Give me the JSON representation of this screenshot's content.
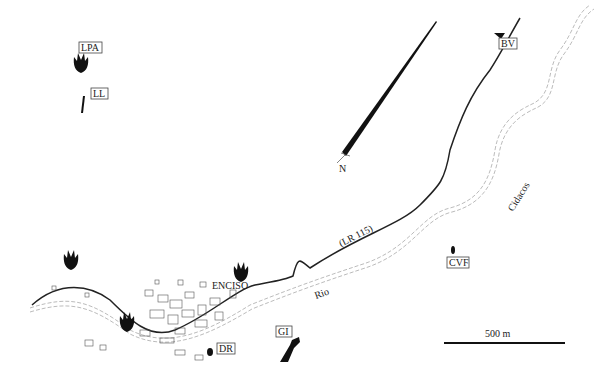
{
  "map": {
    "town_label": "ENCISO",
    "road_label": "(LR 115)",
    "river_label_lower": "Rio",
    "river_label_upper": "Cidacos",
    "north_label": "N",
    "scale_label": "500 m",
    "sites": [
      {
        "code": "LPA",
        "marker": "tridactyl-footprint-icon"
      },
      {
        "code": "LL",
        "marker": "elongated-track-icon"
      },
      {
        "code": "BV",
        "marker": "site-marker-icon"
      },
      {
        "code": "CVF",
        "marker": "small-track-icon"
      },
      {
        "code": "GI",
        "marker": "outcrop-icon"
      },
      {
        "code": "DR",
        "marker": "small-track-icon"
      }
    ],
    "unlabeled_footprints": 3,
    "colors": {
      "ink": "#1a1a1a",
      "river": "#999999",
      "background": "#ffffff"
    }
  }
}
